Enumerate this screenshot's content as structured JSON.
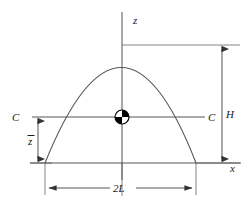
{
  "figure": {
    "background_color": "#ffffff",
    "line_color": "#555555",
    "label_color": "#1a1a1a"
  },
  "axes": {
    "vertical": {
      "name": "z-axis",
      "label": "z",
      "x": 122,
      "y_top": 12,
      "y_bottom": 180
    },
    "horizontal": {
      "name": "x-axis",
      "label": "x",
      "y": 163,
      "x_left": 30,
      "x_right": 241
    }
  },
  "curve": {
    "name": "parabola",
    "apex_x": 122,
    "apex_y": 45,
    "left_x": 45,
    "right_x": 196,
    "base_y": 163
  },
  "centroid": {
    "name": "centroid-symbol",
    "x": 122,
    "y": 117,
    "radius": 7
  },
  "centroidal_axis": {
    "label_left": "C",
    "label_right": "C",
    "y": 117,
    "x_start": 32,
    "x_end": 205
  },
  "dimensions": {
    "height": {
      "label": "H",
      "x": 222,
      "y_top": 45,
      "y_bottom": 163
    },
    "centroid_height": {
      "label": "z",
      "label_overbar": true,
      "x": 38,
      "y_top": 117,
      "y_bottom": 163
    },
    "base_width": {
      "label": "2L",
      "y": 188,
      "x_left": 45,
      "x_right": 196
    }
  }
}
